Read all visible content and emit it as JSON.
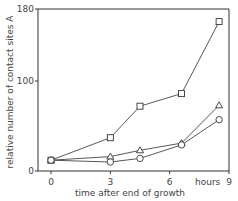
{
  "chart_data": {
    "type": "line",
    "title": "",
    "xlabel": "time after end of growth",
    "x_unit_label": "hours",
    "ylabel": "relative number of contact sites A",
    "xlim": [
      0,
      9
    ],
    "ylim": [
      0,
      180
    ],
    "x_ticks": [
      0,
      3,
      6,
      9
    ],
    "x_tick_labels": [
      "0",
      "3",
      "6",
      "9"
    ],
    "y_ticks": [
      0,
      100,
      180
    ],
    "y_tick_labels": [
      "0",
      "100",
      "180"
    ],
    "grid": false,
    "legend": null,
    "series": [
      {
        "name": "squares",
        "marker": "square",
        "x": [
          0,
          3,
          4.5,
          6.6,
          8.5
        ],
        "values": [
          12,
          37,
          72,
          86,
          166
        ]
      },
      {
        "name": "triangles",
        "marker": "triangle",
        "x": [
          0,
          3,
          4.5,
          6.6,
          8.5
        ],
        "values": [
          12,
          16,
          23,
          31,
          73
        ]
      },
      {
        "name": "circles",
        "marker": "circle",
        "x": [
          0,
          3,
          4.5,
          6.6,
          8.5
        ],
        "values": [
          12,
          10,
          14,
          29,
          57
        ]
      }
    ]
  }
}
